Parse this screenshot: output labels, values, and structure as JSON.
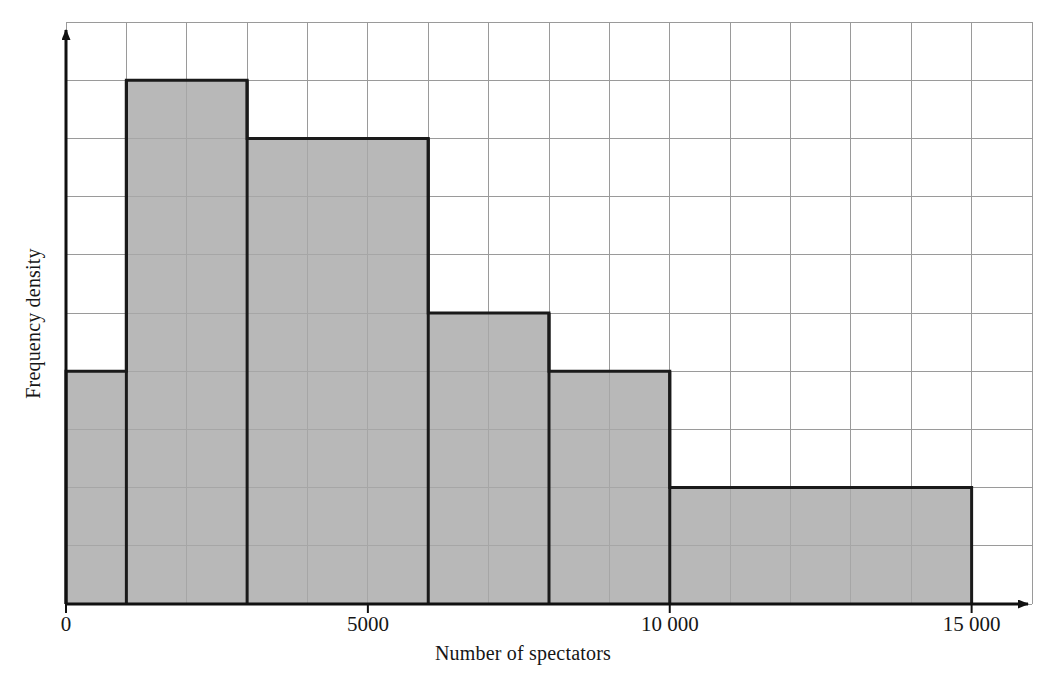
{
  "chart_data": {
    "type": "bar",
    "title": "",
    "subtitle": "",
    "xlabel": "Number of spectators",
    "ylabel": "Frequency density",
    "xlim": [
      0,
      16000
    ],
    "ylim": [
      0,
      10
    ],
    "xtick_values": [
      0,
      5000,
      10000,
      15000
    ],
    "xtick_labels": [
      "0",
      "5000",
      "10 000",
      "15 000"
    ],
    "ytick_labels": [],
    "grid": true,
    "grid_x_step": 1000,
    "grid_y_step": 1,
    "legend": "none",
    "bins": [
      {
        "label": "0–1000",
        "start": 0,
        "end": 1000,
        "value": 4
      },
      {
        "label": "1000–3000",
        "start": 1000,
        "end": 3000,
        "value": 9
      },
      {
        "label": "3000–6000",
        "start": 3000,
        "end": 6000,
        "value": 8
      },
      {
        "label": "6000–8000",
        "start": 6000,
        "end": 8000,
        "value": 5
      },
      {
        "label": "8000–10000",
        "start": 8000,
        "end": 10000,
        "value": 4
      },
      {
        "label": "10000–15000",
        "start": 10000,
        "end": 15000,
        "value": 2
      }
    ],
    "bar_fill": "#a8a8a8",
    "bar_stroke": "#1a1a1a",
    "grid_color": "#9a9a9a",
    "axis_color": "#111111"
  },
  "axes": {
    "x_title": "Number of spectators",
    "y_title": "Frequency density"
  },
  "ticks": {
    "x": [
      {
        "value": 0,
        "label": "0"
      },
      {
        "value": 5000,
        "label": "5000"
      },
      {
        "value": 10000,
        "label": "10 000"
      },
      {
        "value": 15000,
        "label": "15 000"
      }
    ]
  }
}
